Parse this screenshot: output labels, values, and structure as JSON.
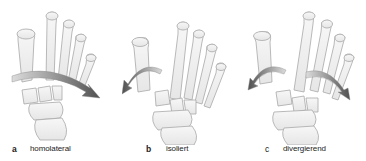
{
  "figure": {
    "panels": [
      {
        "letter": "a",
        "label": "homolateral"
      },
      {
        "letter": "b",
        "label": "isoliert"
      },
      {
        "letter": "c",
        "label": "divergierend"
      }
    ]
  },
  "colors": {
    "bone_fill": "#f4f4f4",
    "bone_stroke": "#a8a8a8",
    "arrow_dark": "#555555",
    "arrow_light": "#d0d0d0",
    "caption_text": "#222222"
  }
}
